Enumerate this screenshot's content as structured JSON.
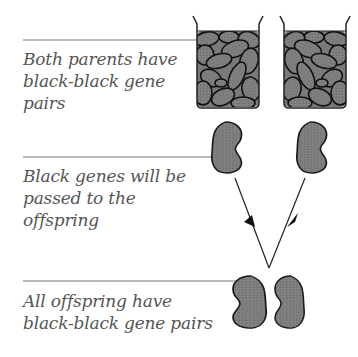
{
  "labels": {
    "parents": "Both parents have black-black gene pairs",
    "genes": "Black genes will be passed to the offspring",
    "offspring": "All offspring have black-black gene pairs"
  },
  "label_lines": {
    "parents": [
      "Both parents have",
      "black-black gene",
      "pairs"
    ],
    "genes": [
      "Black genes will be",
      "passed to the",
      "offspring"
    ],
    "offspring": [
      "All offspring have",
      "black-black gene pairs"
    ]
  },
  "colors": {
    "seed_fill": "#7a7a7a",
    "outline": "#1a1a1a",
    "text": "#555555",
    "leader_line": "#777777"
  }
}
